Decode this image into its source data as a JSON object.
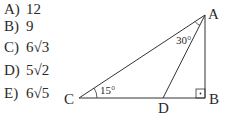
{
  "choices": [
    {
      "letter": "A)",
      "value": "12"
    },
    {
      "letter": "B)",
      "value": "9"
    },
    {
      "letter": "C)",
      "value": "6√3"
    },
    {
      "letter": "D)",
      "value": "5√2"
    },
    {
      "letter": "E)",
      "value": "6√5"
    }
  ],
  "figure": {
    "vertices": {
      "A": "A",
      "B": "B",
      "C": "C",
      "D": "D"
    },
    "angles": {
      "C": "15°",
      "DAC": "30°"
    },
    "right_angle_at": "B"
  }
}
